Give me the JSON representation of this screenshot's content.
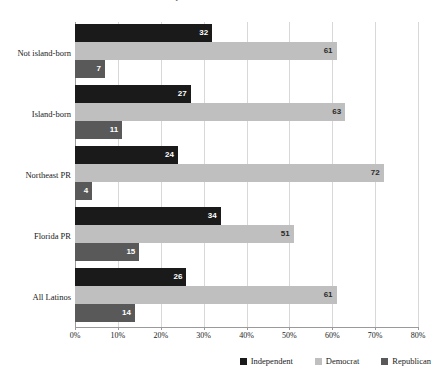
{
  "chart_data": {
    "type": "bar",
    "orientation": "horizontal",
    "title": "Party Identification of Latinos",
    "categories": [
      "Not island-born",
      "Island-born",
      "Northeast PR",
      "Florida PR",
      "All Latinos"
    ],
    "series": [
      {
        "name": "Independent",
        "color": "#1a1a1a",
        "values": [
          32,
          27,
          24,
          34,
          26
        ]
      },
      {
        "name": "Democrat",
        "color": "#bfbfbf",
        "values": [
          61,
          63,
          72,
          51,
          61
        ]
      },
      {
        "name": "Republican",
        "color": "#595959",
        "values": [
          7,
          11,
          4,
          15,
          14
        ]
      }
    ],
    "xlabel": "",
    "ylabel": "",
    "xlim": [
      0,
      80
    ],
    "xtick_values": [
      0,
      10,
      20,
      30,
      40,
      50,
      60,
      70,
      80
    ],
    "xtick_labels": [
      "0%",
      "10%",
      "20%",
      "30%",
      "40%",
      "50%",
      "60%",
      "70%",
      "80%"
    ],
    "grid": true,
    "grid_axis": "x",
    "legend_position": "bottom-right",
    "value_labels": true
  }
}
